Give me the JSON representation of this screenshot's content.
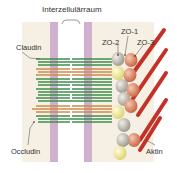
{
  "title": "Interzellulärraum",
  "labels": {
    "claudin": "Claudin",
    "occludin": "Occludin",
    "aktin": "Aktin",
    "zo1": "ZO-1",
    "zo2": "ZO-2",
    "zo3": "ZO-3"
  },
  "colors": {
    "background": "#f6efe3",
    "membrane": "#c9a9c9",
    "claudin": "#3f8f4e",
    "occludin": "#d08a4a",
    "zo1": "#e4907a",
    "zo2": "#c8c2b8",
    "zo_yellow": "#f2ef9a",
    "aktin": "#c8281e"
  },
  "strands": [
    "claudin",
    "occludin",
    "claudin",
    "claudin",
    "claudin",
    "occludin",
    "claudin"
  ]
}
